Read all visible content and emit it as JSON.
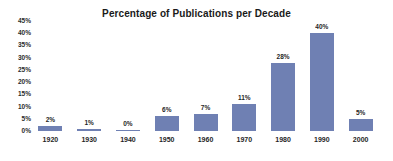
{
  "title": "Percentage of Publications per Decade",
  "colors": {
    "bar": "#6F80B3",
    "title_text": "#1A1A1A",
    "label_text": "#1F1F1F",
    "background": "#FFFFFF"
  },
  "chart_data": {
    "type": "bar",
    "title": "Percentage of Publications per Decade",
    "categories": [
      "1920",
      "1930",
      "1940",
      "1950",
      "1960",
      "1970",
      "1980",
      "1990",
      "2000"
    ],
    "values": [
      2,
      1,
      0,
      6,
      7,
      11,
      28,
      40,
      5
    ],
    "data_labels": [
      "2%",
      "1%",
      "0%",
      "6%",
      "7%",
      "11%",
      "28%",
      "40%",
      "5%"
    ],
    "xlabel": "",
    "ylabel": "",
    "ylim": [
      0,
      45
    ],
    "ytick_interval": 5,
    "ytick_labels": [
      "0%",
      "5%",
      "10%",
      "15%",
      "20%",
      "25%",
      "30%",
      "35%",
      "40%",
      "45%"
    ],
    "grid": false,
    "legend": false,
    "bar_color": "#6F80B3"
  }
}
